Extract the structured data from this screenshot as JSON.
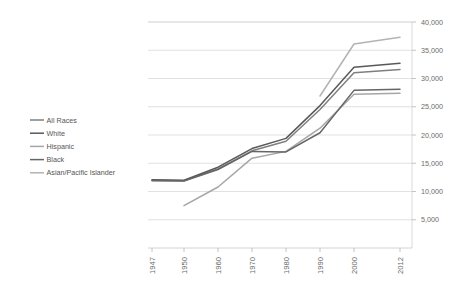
{
  "chart_data": {
    "type": "line",
    "title": "",
    "subtitle": "",
    "xlabel": "",
    "ylabel": "",
    "grid": true,
    "legend_position": "left",
    "x": [
      "1947",
      "1950",
      "1960",
      "1970",
      "1980",
      "1990",
      "2000",
      "2012"
    ],
    "xtick_labels": [
      "1947",
      "1950",
      "1960",
      "1970",
      "1980",
      "1990",
      "2000",
      "2012"
    ],
    "ytick_labels": [
      "5,000",
      "10,000",
      "15,000",
      "20,000",
      "25,000",
      "30,000",
      "35,000",
      "40,000"
    ],
    "ytick_values": [
      5000,
      10000,
      15000,
      20000,
      25000,
      30000,
      35000,
      40000
    ],
    "ylim": [
      0,
      40000
    ],
    "series": [
      {
        "name": "All Races",
        "color": "#7f7f7f",
        "values": [
          12000,
          11900,
          14000,
          17200,
          18900,
          24500,
          31000,
          31600
        ]
      },
      {
        "name": "White",
        "color": "#595959",
        "values": [
          12100,
          12000,
          14300,
          17600,
          19400,
          25200,
          32000,
          32700
        ]
      },
      {
        "name": "Hispanic",
        "color": "#a6a6a6",
        "values": [
          null,
          7500,
          10800,
          15900,
          17100,
          21200,
          27200,
          27400
        ]
      },
      {
        "name": "Black",
        "color": "#666666",
        "values": [
          11900,
          11850,
          13900,
          17100,
          17000,
          20400,
          27900,
          28100
        ]
      },
      {
        "name": "Asian/Pacific Islander",
        "color": "#b3b3b3",
        "values": [
          null,
          null,
          null,
          null,
          null,
          26900,
          36100,
          37300
        ]
      }
    ]
  },
  "legend": {
    "items": [
      {
        "label": "All Races"
      },
      {
        "label": "White"
      },
      {
        "label": "Hispanic"
      },
      {
        "label": "Black"
      },
      {
        "label": "Asian/Pacific Islander"
      }
    ]
  },
  "axes": {
    "y_labels": [
      "40,000",
      "35,000",
      "30,000",
      "25,000",
      "20,000",
      "15,000",
      "10,000",
      "5,000"
    ],
    "x_labels": [
      "1947",
      "1950",
      "1960",
      "1970",
      "1980",
      "1990",
      "2000",
      "2012"
    ]
  }
}
